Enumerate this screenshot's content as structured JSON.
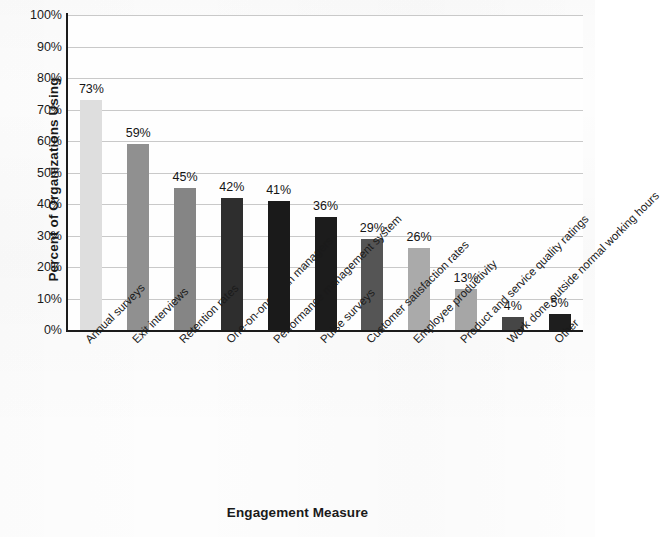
{
  "chart_data": {
    "type": "bar",
    "title": "",
    "xlabel": "Engagement Measure",
    "ylabel": "Percent of Organizations Using",
    "ylim": [
      0,
      100
    ],
    "grid": true,
    "legend": "none",
    "y_tick_labels": [
      "100%",
      "90%",
      "80%",
      "70%",
      "60%",
      "50%",
      "40%",
      "30%",
      "20%",
      "10%",
      "0%"
    ],
    "y_ticks": [
      100,
      90,
      80,
      70,
      60,
      50,
      40,
      30,
      20,
      10,
      0
    ],
    "categories": [
      "Annual surveys",
      "Exit interviews",
      "Retention rates",
      "One-on-ones with managers",
      "Performance management system",
      "Pulse surveys",
      "Customer satisfaction rates",
      "Employee productivity",
      "Product and service quality ratings",
      "Work done outside normal working hours",
      "Other"
    ],
    "values": [
      73,
      59,
      45,
      42,
      41,
      36,
      29,
      26,
      13,
      4,
      5
    ],
    "value_labels": [
      "73%",
      "59%",
      "45%",
      "42%",
      "41%",
      "36%",
      "29%",
      "26%",
      "13%",
      "4%",
      "5%"
    ],
    "bar_colors": [
      "#dedede",
      "#909090",
      "#858585",
      "#2e2e2e",
      "#1a1a1a",
      "#1c1c1c",
      "#555555",
      "#aaaaaa",
      "#a6a6a6",
      "#464646",
      "#1e1e1e"
    ]
  },
  "style": {
    "gridline_color": "#c9c9c9",
    "axis_color": "#1b1b1b",
    "text_color": "#1a1a1a",
    "background": "#fdfdfd"
  }
}
